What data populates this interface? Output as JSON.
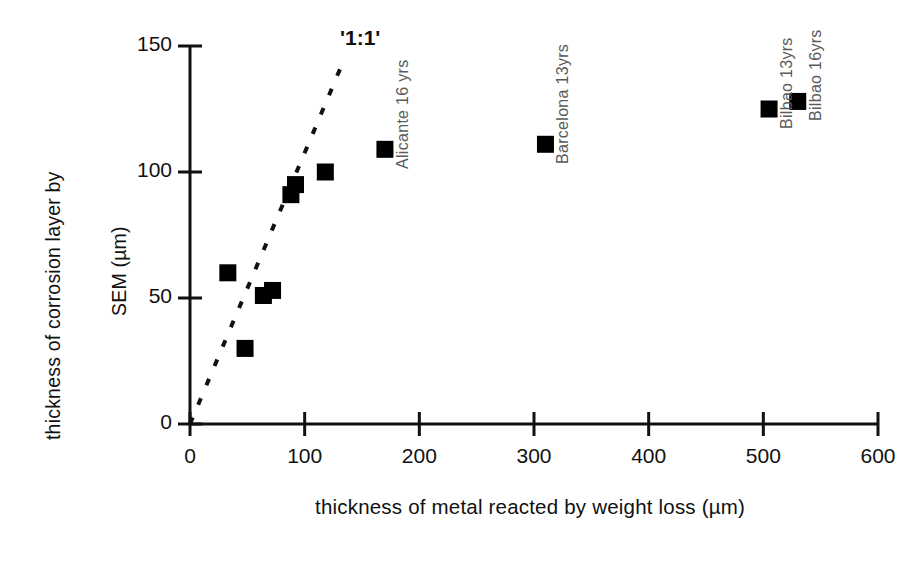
{
  "chart_data": {
    "type": "scatter",
    "title": "",
    "xlabel": "thickness of metal reacted by weight loss   (µm)",
    "ylabel_line1": "thickness of corrosion layer by",
    "ylabel_line2": "SEM  (µm)",
    "xlim": [
      0,
      600
    ],
    "ylim": [
      0,
      150
    ],
    "xticks": [
      0,
      100,
      200,
      300,
      400,
      500,
      600
    ],
    "yticks": [
      0,
      50,
      100,
      150
    ],
    "xtick_labels": [
      "0",
      "100",
      "200",
      "300",
      "400",
      "500",
      "600"
    ],
    "ytick_labels": [
      "0",
      "50",
      "100",
      "150"
    ],
    "grid": false,
    "legend": "none",
    "marker": "filled-square",
    "marker_color": "#000000",
    "points": [
      {
        "x": 33,
        "y": 60,
        "label": ""
      },
      {
        "x": 48,
        "y": 30,
        "label": ""
      },
      {
        "x": 64,
        "y": 51,
        "label": ""
      },
      {
        "x": 72,
        "y": 53,
        "label": ""
      },
      {
        "x": 88,
        "y": 91,
        "label": ""
      },
      {
        "x": 92,
        "y": 95,
        "label": ""
      },
      {
        "x": 118,
        "y": 100,
        "label": ""
      },
      {
        "x": 170,
        "y": 109,
        "label": "Alicante 16 yrs"
      },
      {
        "x": 310,
        "y": 111,
        "label": "Barcelona 13yrs"
      },
      {
        "x": 505,
        "y": 125,
        "label": "Bilbao 13yrs"
      },
      {
        "x": 530,
        "y": 128,
        "label": "Bilbao 16yrs"
      }
    ],
    "reference_line": {
      "label": "'1:1'",
      "style": "dashed",
      "from": [
        0,
        0
      ],
      "to": [
        131,
        141
      ],
      "slope": 1.0
    },
    "annotations": [
      {
        "text": "Alicante 16 yrs",
        "x": 170,
        "y": 109,
        "orientation": "vertical"
      },
      {
        "text": "Barcelona 13yrs",
        "x": 310,
        "y": 111,
        "orientation": "vertical"
      },
      {
        "text": "Bilbao 13yrs",
        "x": 505,
        "y": 125,
        "orientation": "vertical"
      },
      {
        "text": "Bilbao 16yrs",
        "x": 530,
        "y": 128,
        "orientation": "vertical"
      },
      {
        "text": "'1:1'",
        "x": 131,
        "y": 150,
        "orientation": "horizontal"
      }
    ]
  },
  "axes": {
    "y_label_line1": "thickness of corrosion layer by",
    "y_label_line2": "SEM  (µm)",
    "x_label": "thickness of metal reacted by weight loss   (µm)",
    "y_ticks": [
      {
        "value": 150,
        "text": "150"
      },
      {
        "value": 100,
        "text": "100"
      },
      {
        "value": 50,
        "text": "50"
      },
      {
        "value": 0,
        "text": "0"
      }
    ],
    "x_ticks": [
      {
        "value": 0,
        "text": "0"
      },
      {
        "value": 100,
        "text": "100"
      },
      {
        "value": 200,
        "text": "200"
      },
      {
        "value": 300,
        "text": "300"
      },
      {
        "value": 400,
        "text": "400"
      },
      {
        "value": 500,
        "text": "500"
      },
      {
        "value": 600,
        "text": "600"
      }
    ]
  },
  "reference_line_label": "'1:1'",
  "colors": {
    "marker": "#000000",
    "axis": "#111111",
    "annotation": "#5b5b5b",
    "background": "#ffffff"
  }
}
